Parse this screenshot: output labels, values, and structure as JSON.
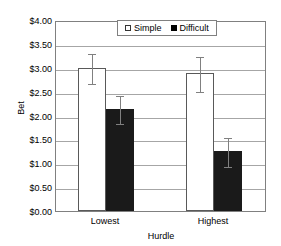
{
  "chart_data": {
    "type": "bar",
    "title": "",
    "xlabel": "Hurdle",
    "ylabel": "Bet",
    "categories": [
      "Lowest",
      "Highest"
    ],
    "ylim": [
      0,
      4
    ],
    "ytick_labels": [
      "$0.00",
      "$0.50",
      "$1.00",
      "$1.50",
      "$2.00",
      "$2.50",
      "$3.00",
      "$3.50",
      "$4.00"
    ],
    "ytick_values": [
      0,
      0.5,
      1,
      1.5,
      2,
      2.5,
      3,
      3.5,
      4
    ],
    "grid": "horizontal",
    "legend_position": "top-center",
    "series": [
      {
        "name": "Simple",
        "color": "#ffffff",
        "values": [
          3.0,
          2.9
        ],
        "error_low": [
          2.67,
          2.52
        ],
        "error_high": [
          3.33,
          3.27
        ]
      },
      {
        "name": "Difficult",
        "color": "#1a1a1a",
        "values": [
          2.14,
          1.25
        ],
        "error_low": [
          1.84,
          0.95
        ],
        "error_high": [
          2.44,
          1.57
        ]
      }
    ]
  },
  "legend": {
    "entries": [
      {
        "label": "Simple"
      },
      {
        "label": "Difficult"
      }
    ]
  }
}
